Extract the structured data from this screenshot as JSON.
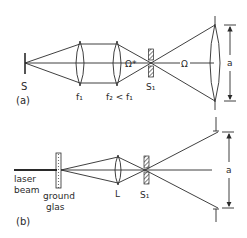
{
  "panel_a": {
    "tag": "(a)",
    "source_label": "S",
    "lens1_label": "f₁",
    "lens2_label": "f₂ < f₁",
    "omega_star_label": "Ω*",
    "slit_label": "S₁",
    "omega_label": "Ω",
    "dimension_label": "a"
  },
  "panel_b": {
    "tag": "(b)",
    "laser_label_line1": "laser",
    "laser_label_line2": "beam",
    "ground_label_line1": "ground",
    "ground_label_line2": "glas",
    "lens_label": "L",
    "slit_label": "S₁",
    "dimension_label": "a"
  },
  "colors": {
    "ink": "#2a2a2a",
    "background": "#ffffff"
  }
}
